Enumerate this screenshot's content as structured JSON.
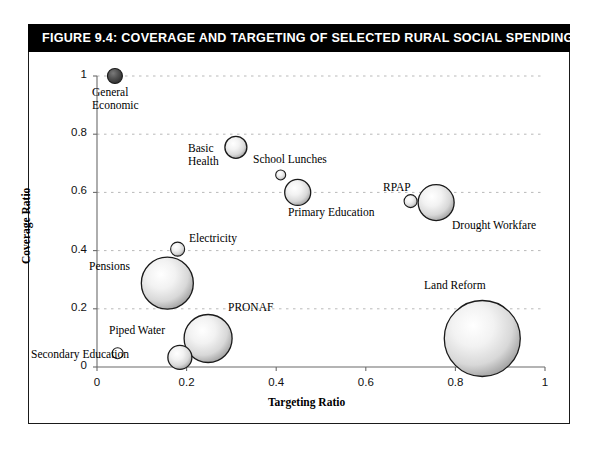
{
  "figure": {
    "title": "FIGURE 9.4:  COVERAGE AND TARGETING OF SELECTED RURAL SOCIAL SPENDING PROGRAMS"
  },
  "chart_data": {
    "type": "scatter",
    "title": "Coverage and Targeting of Selected Rural Social Spending Programs",
    "xlabel": "Targeting Ratio",
    "ylabel": "Coverage Ratio",
    "xlim": [
      0,
      1
    ],
    "ylim": [
      0,
      1
    ],
    "xticks": [
      "0",
      "0.2",
      "0.4",
      "0.6",
      "0.8",
      "1"
    ],
    "yticks": [
      "0",
      "0.2",
      "0.4",
      "0.6",
      "0.8",
      "1"
    ],
    "grid": "horizontal-dotted",
    "legend": "none",
    "note": "bubble size encodes relative program spending",
    "points": [
      {
        "label": "General Economic",
        "x": 0.04,
        "y": 1.0,
        "r": 7.5,
        "fill": "dark"
      },
      {
        "label": "Basic Health",
        "x": 0.31,
        "y": 0.755,
        "r": 11.0,
        "fill": "light"
      },
      {
        "label": "School Lunches",
        "x": 0.41,
        "y": 0.66,
        "r": 5.0,
        "fill": "light"
      },
      {
        "label": "Primary Education",
        "x": 0.448,
        "y": 0.6,
        "r": 13.0,
        "fill": "light"
      },
      {
        "label": "RPAP",
        "x": 0.7,
        "y": 0.57,
        "r": 6.5,
        "fill": "light"
      },
      {
        "label": "Drought Workfare",
        "x": 0.757,
        "y": 0.565,
        "r": 18.0,
        "fill": "light"
      },
      {
        "label": "Electricity",
        "x": 0.18,
        "y": 0.405,
        "r": 7.0,
        "fill": "light"
      },
      {
        "label": "Pensions",
        "x": 0.157,
        "y": 0.288,
        "r": 26.0,
        "fill": "light"
      },
      {
        "label": "Land Reform",
        "x": 0.86,
        "y": 0.098,
        "r": 38.0,
        "fill": "light"
      },
      {
        "label": "PRONAF",
        "x": 0.248,
        "y": 0.098,
        "r": 24.0,
        "fill": "light"
      },
      {
        "label": "Piped Water",
        "x": 0.046,
        "y": 0.047,
        "r": 5.5,
        "fill": "white"
      },
      {
        "label": "Secondary Education",
        "x": 0.185,
        "y": 0.033,
        "r": 12.0,
        "fill": "light"
      }
    ]
  },
  "labels": {
    "general_economic_1": "General",
    "general_economic_2": "Economic",
    "basic_health_1": "Basic",
    "basic_health_2": "Health",
    "school_lunches": "School Lunches",
    "primary_education": "Primary Education",
    "rpap": "RPAP",
    "drought_workfare": "Drought Workfare",
    "electricity": "Electricity",
    "pensions": "Pensions",
    "land_reform": "Land Reform",
    "pronaf": "PRONAF",
    "piped_water": "Piped Water",
    "secondary_education": "Secondary Education"
  },
  "axes": {
    "x_title": "Targeting Ratio",
    "y_title": "Coverage Ratio",
    "x_ticks": [
      "0",
      "0.2",
      "0.4",
      "0.6",
      "0.8",
      "1"
    ],
    "y_ticks": [
      "0",
      "0.2",
      "0.4",
      "0.6",
      "0.8",
      "1"
    ]
  },
  "colors": {
    "title_bar_bg": "#000000",
    "title_text": "#ffffff",
    "frame_border": "#1a1a1a",
    "axis_line": "#6b6b6b",
    "grid_line": "#b9b9b9",
    "bubble_stroke": "#1a1a1a",
    "bubble_dark": "#4a4a4a",
    "bubble_light": "#e9e9e9",
    "text": "#000000"
  }
}
